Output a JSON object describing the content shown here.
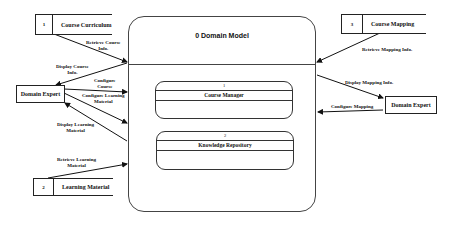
{
  "diagram": {
    "type": "data-flow-diagram",
    "main_process": {
      "id": "0",
      "title": "0 Domain Model"
    },
    "sub_processes": [
      {
        "number": "1",
        "name": "Course Manager"
      },
      {
        "number": "2",
        "name": "Knowledge Repository"
      }
    ],
    "data_stores": [
      {
        "number": "1",
        "name": "Course Curriculum"
      },
      {
        "number": "3",
        "name": "Course Mapping"
      },
      {
        "number": "2",
        "name": "Learning Material"
      }
    ],
    "external_entities": {
      "left": "Domain Expert",
      "right": "Domain Expert"
    },
    "flows": {
      "retrieve_course_info": "Retrieve Course Info.",
      "display_course_info": "Display Course Info.",
      "configure_course": "Configure Course",
      "configure_learning_material": "Configure Learning Material",
      "display_learning_material": "Display Learning Material",
      "retrieve_learning_material": "Retrieve Learning Material",
      "retrieve_mapping_info": "Retrieve Mapping Info.",
      "display_mapping_info": "Display Mapping Info.",
      "configure_mapping": "Configure Mapping"
    },
    "flow_lines": {
      "retrieve_course_info_1": "Retrieve Course",
      "retrieve_course_info_2": "Info.",
      "display_course_info_1": "Display Course",
      "display_course_info_2": "Info.",
      "configure_course_1": "Configure",
      "configure_course_2": "Course",
      "configure_learning_material_1": "Configure Learning",
      "configure_learning_material_2": "Material",
      "display_learning_material_1": "Display Learning",
      "display_learning_material_2": "Material",
      "retrieve_learning_material_1": "Retrieve Learning",
      "retrieve_learning_material_2": "Material"
    }
  }
}
